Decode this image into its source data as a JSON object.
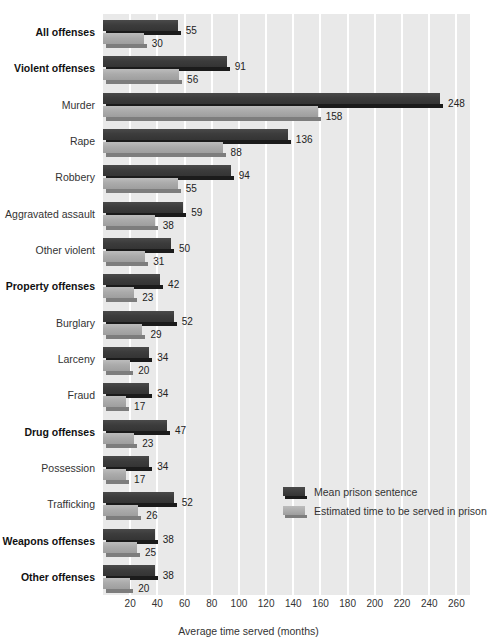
{
  "chart_data": {
    "type": "bar",
    "orientation": "horizontal",
    "title": "",
    "xlabel": "Average time served (months)",
    "ylabel": "",
    "xlim": [
      0,
      270
    ],
    "xticks": [
      20,
      40,
      60,
      80,
      100,
      120,
      140,
      160,
      180,
      200,
      220,
      240,
      260
    ],
    "grid": "vertical-white",
    "legend_position": "inside-right-lower",
    "categories": [
      "All offenses",
      "Violent offenses",
      "Murder",
      "Rape",
      "Robbery",
      "Aggravated assault",
      "Other violent",
      "Property offenses",
      "Burglary",
      "Larceny",
      "Fraud",
      "Drug offenses",
      "Possession",
      "Trafficking",
      "Weapons offenses",
      "Other offenses"
    ],
    "category_emphasis": [
      true,
      true,
      false,
      false,
      false,
      false,
      false,
      true,
      false,
      false,
      false,
      true,
      false,
      false,
      true,
      true
    ],
    "series": [
      {
        "name": "Mean prison sentence",
        "color": "#3c3c3c",
        "values": [
          55,
          91,
          248,
          136,
          94,
          59,
          50,
          42,
          52,
          34,
          34,
          47,
          34,
          52,
          38,
          38
        ]
      },
      {
        "name": "Estimated time to be served in prison",
        "color": "#ababab",
        "values": [
          30,
          56,
          158,
          88,
          55,
          38,
          31,
          23,
          29,
          20,
          17,
          23,
          17,
          26,
          25,
          20
        ]
      }
    ]
  },
  "axis": {
    "x_title": "Average time served (months)"
  },
  "legend": {
    "items": [
      {
        "label": "Mean prison sentence",
        "swatch": "dark"
      },
      {
        "label": "Estimated time to be served in prison",
        "swatch": "light"
      }
    ]
  }
}
